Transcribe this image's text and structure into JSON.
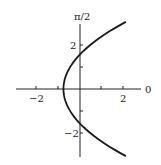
{
  "chart_data": {
    "type": "line",
    "title": "",
    "xlabel": "0",
    "ylabel": "π/2",
    "xlim": [
      -3,
      2.8
    ],
    "ylim": [
      -3.1,
      3.0
    ],
    "x_ticks": [
      -2,
      -1,
      1,
      2
    ],
    "x_tick_labels": [
      "-2",
      "2"
    ],
    "y_ticks": [
      -2,
      -1,
      1,
      2
    ],
    "y_tick_labels": [
      "-2",
      "2"
    ],
    "grid": false,
    "legend": null,
    "series": [
      {
        "name": "curve",
        "description": "Parabola opening right, vertex near (-0.77, 0), crossing vertical axis at ±π/2",
        "x": [
          2.23,
          1.6,
          1.0,
          0.5,
          0.0,
          -0.4,
          -0.65,
          -0.77,
          -0.65,
          -0.4,
          0.0,
          0.5,
          1.0,
          1.6,
          2.23
        ],
        "y": [
          3.05,
          2.7,
          2.34,
          2.0,
          1.57,
          1.14,
          0.62,
          0.0,
          -0.62,
          -1.14,
          -1.57,
          -2.0,
          -2.34,
          -2.7,
          -3.05
        ]
      }
    ],
    "color": "#1a1a1a"
  },
  "labels": {
    "axis_top": "π/2",
    "axis_right": "0",
    "x_neg2": "−2",
    "x_pos2": "2",
    "y_pos2": "2",
    "y_neg2": "−2"
  }
}
